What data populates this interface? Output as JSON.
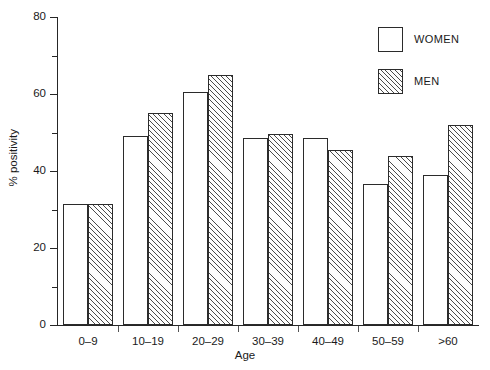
{
  "chart_data": {
    "type": "bar",
    "title": "",
    "subtitle": "",
    "xlabel": "Age",
    "ylabel": "% positivity",
    "categories": [
      "0–9",
      "10–19",
      "20–29",
      "30–39",
      "40–49",
      "50–59",
      ">60"
    ],
    "series": [
      {
        "name": "WOMEN",
        "values": [
          31.5,
          49,
          60.5,
          48.5,
          48.5,
          36.5,
          39
        ],
        "fill": "white",
        "pattern": "none"
      },
      {
        "name": "MEN",
        "values": [
          31.5,
          55,
          65,
          49.5,
          45.5,
          44,
          52
        ],
        "fill": "white",
        "pattern": "diagonal-hatch"
      }
    ],
    "ylim": [
      0,
      80
    ],
    "y_major_ticks": [
      0,
      20,
      40,
      60,
      80
    ],
    "y_minor_ticks": [
      10,
      30,
      50,
      70
    ],
    "y_tick_labels": [
      "0",
      "20",
      "40",
      "60",
      "80"
    ],
    "grid": false,
    "legend_position": "top-right",
    "legend_entries": [
      "WOMEN",
      "MEN"
    ]
  },
  "axes": {
    "y_title": "% positivity",
    "x_title": "Age"
  },
  "legend": {
    "women_label": "WOMEN",
    "men_label": "MEN"
  },
  "colors": {
    "line": "#2b2b2b",
    "hatch": "#4a4a4a",
    "background": "#ffffff",
    "text": "#1a1a1a"
  }
}
